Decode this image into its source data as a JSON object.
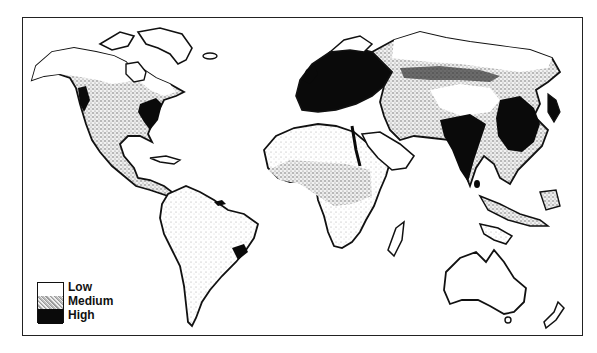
{
  "map": {
    "subject": "world population density",
    "colors": {
      "low": "#ffffff",
      "medium": "#bdbdbd",
      "high": "#0a0a0a",
      "outline": "#111111"
    }
  },
  "legend": {
    "items": [
      {
        "label": "Low",
        "swatch": "white"
      },
      {
        "label": "Medium",
        "swatch": "stippled gray"
      },
      {
        "label": "High",
        "swatch": "black"
      }
    ]
  }
}
